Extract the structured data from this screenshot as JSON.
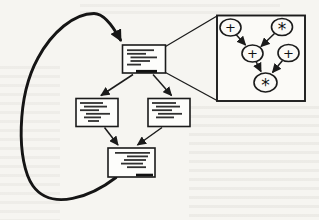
{
  "figure": {
    "ink_color": "#1b1b1b",
    "paper_color": "#f6f5f1",
    "kind": "flow-graph-with-dag-callout"
  },
  "flow_graph": {
    "blocks": [
      {
        "id": "block-top"
      },
      {
        "id": "block-left"
      },
      {
        "id": "block-right"
      },
      {
        "id": "block-bottom"
      }
    ],
    "edges": [
      {
        "from": "block-top",
        "to": "block-left"
      },
      {
        "from": "block-top",
        "to": "block-right"
      },
      {
        "from": "block-left",
        "to": "block-bottom"
      },
      {
        "from": "block-right",
        "to": "block-bottom"
      },
      {
        "from": "block-bottom",
        "to": "block-top",
        "style": "thick-loop-back"
      }
    ]
  },
  "callout": {
    "from": "block-top",
    "to": "dag-detail-box"
  },
  "dag": {
    "nodes": [
      {
        "id": "plus-1",
        "op": "+"
      },
      {
        "id": "star-1",
        "op": "*"
      },
      {
        "id": "plus-2",
        "op": "+"
      },
      {
        "id": "plus-3",
        "op": "+"
      },
      {
        "id": "star-2",
        "op": "*"
      }
    ],
    "edges": [
      {
        "from": "plus-1",
        "to": "plus-2"
      },
      {
        "from": "star-1",
        "to": "plus-2"
      },
      {
        "from": "plus-2",
        "to": "star-2"
      },
      {
        "from": "plus-3",
        "to": "star-2"
      }
    ]
  }
}
